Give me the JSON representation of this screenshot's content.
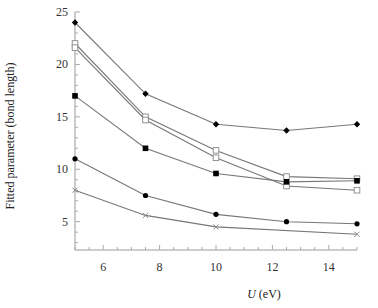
{
  "chart_data": {
    "type": "line",
    "title": "",
    "xlabel_italic": "U",
    "xlabel_rest": " (eV)",
    "ylabel": "Fitted parameter (bond length)",
    "xlim": [
      5,
      15
    ],
    "ylim": [
      2.3,
      25
    ],
    "xticks": [
      6,
      8,
      10,
      12,
      14
    ],
    "yticks": [
      5,
      10,
      15,
      20,
      25
    ],
    "x_minor_step": 0.5,
    "y_minor_step": 1,
    "grid": false,
    "legend": "none",
    "series": [
      {
        "name": "filled-diamond",
        "marker": "diamond-filled",
        "x": [
          5,
          7.5,
          10,
          12.5,
          15
        ],
        "y": [
          24.0,
          17.2,
          14.3,
          13.7,
          14.3
        ]
      },
      {
        "name": "open-square-upper",
        "marker": "square-open",
        "x": [
          5,
          7.5,
          10,
          12.5,
          15
        ],
        "y": [
          22.0,
          15.0,
          11.8,
          9.3,
          9.1
        ]
      },
      {
        "name": "open-square-lower",
        "marker": "square-open",
        "x": [
          5,
          7.5,
          10,
          12.5,
          15
        ],
        "y": [
          21.6,
          14.7,
          11.1,
          8.4,
          8.0
        ]
      },
      {
        "name": "filled-square",
        "marker": "square-filled",
        "x": [
          5,
          7.5,
          10,
          12.5,
          15
        ],
        "y": [
          17.0,
          12.0,
          9.6,
          8.8,
          8.9
        ]
      },
      {
        "name": "filled-circle",
        "marker": "circle-filled",
        "x": [
          5,
          7.5,
          10,
          12.5,
          15
        ],
        "y": [
          11.0,
          7.5,
          5.7,
          5.0,
          4.8
        ]
      },
      {
        "name": "cross",
        "marker": "cross",
        "x": [
          5,
          7.5,
          10,
          15
        ],
        "y": [
          8.0,
          5.6,
          4.5,
          3.8
        ]
      }
    ]
  }
}
